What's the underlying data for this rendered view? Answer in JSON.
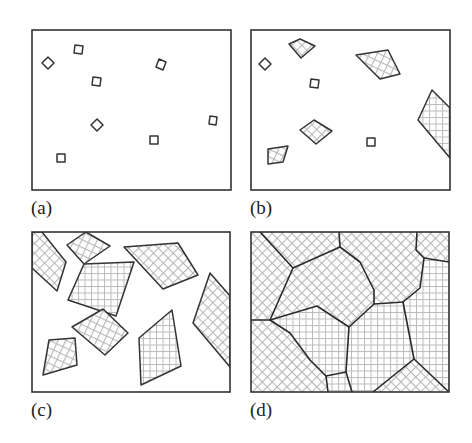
{
  "figure": {
    "colors": {
      "outline": "#2a2a2a",
      "hatch": "#b8b8b8",
      "background": "#ffffff"
    },
    "panels": [
      {
        "id": "a",
        "label": "(a)",
        "stage": "nucleation",
        "frame": [
          32,
          30,
          231,
          190
        ],
        "nuclei": [
          [
            [
              48,
              57
            ],
            [
              54,
              63
            ],
            [
              48,
              69
            ],
            [
              42,
              63
            ]
          ],
          [
            [
              75,
              45
            ],
            [
              83,
              46
            ],
            [
              82,
              54
            ],
            [
              74,
              53
            ]
          ],
          [
            [
              93,
              77
            ],
            [
              101,
              78
            ],
            [
              100,
              86
            ],
            [
              92,
              85
            ]
          ],
          [
            [
              159,
              59
            ],
            [
              166,
              62
            ],
            [
              163,
              70
            ],
            [
              156,
              67
            ]
          ],
          [
            [
              97,
              119
            ],
            [
              103,
              125
            ],
            [
              97,
              131
            ],
            [
              91,
              125
            ]
          ],
          [
            [
              150,
              136
            ],
            [
              158,
              136
            ],
            [
              158,
              144
            ],
            [
              150,
              144
            ]
          ],
          [
            [
              210,
              116
            ],
            [
              217,
              117
            ],
            [
              216,
              125
            ],
            [
              209,
              124
            ]
          ],
          [
            [
              57,
              154
            ],
            [
              65,
              154
            ],
            [
              65,
              162
            ],
            [
              57,
              162
            ]
          ]
        ]
      },
      {
        "id": "b",
        "label": "(b)",
        "stage": "early growth",
        "frame": [
          251,
          30,
          450,
          190
        ],
        "nuclei": [
          [
            [
              265,
              58
            ],
            [
              271,
              64
            ],
            [
              265,
              70
            ],
            [
              259,
              64
            ]
          ],
          [
            [
              311,
              79
            ],
            [
              319,
              80
            ],
            [
              318,
              88
            ],
            [
              310,
              87
            ]
          ],
          [
            [
              367,
              138
            ],
            [
              375,
              138
            ],
            [
              375,
              146
            ],
            [
              367,
              146
            ]
          ]
        ],
        "grains": [
          [
            [
              289,
              44
            ],
            [
              300,
              39
            ],
            [
              315,
              46
            ],
            [
              301,
              58
            ]
          ],
          [
            [
              356,
              55
            ],
            [
              388,
              50
            ],
            [
              400,
              74
            ],
            [
              380,
              79
            ]
          ],
          [
            [
              432,
              90
            ],
            [
              450,
              108
            ],
            [
              450,
              158
            ],
            [
              418,
              120
            ]
          ],
          [
            [
              300,
              130
            ],
            [
              314,
              120
            ],
            [
              332,
              131
            ],
            [
              316,
              144
            ]
          ],
          [
            [
              268,
              149
            ],
            [
              288,
              146
            ],
            [
              283,
              162
            ],
            [
              268,
              164
            ]
          ]
        ]
      },
      {
        "id": "c",
        "label": "(c)",
        "stage": "continued growth",
        "frame": [
          32,
          232,
          230,
          392
        ],
        "grains": [
          [
            [
              32,
              232
            ],
            [
              42,
              232
            ],
            [
              66,
              262
            ],
            [
              57,
              291
            ],
            [
              32,
              268
            ]
          ],
          [
            [
              67,
              245
            ],
            [
              86,
              232
            ],
            [
              110,
              246
            ],
            [
              84,
              264
            ]
          ],
          [
            [
              84,
              264
            ],
            [
              134,
              262
            ],
            [
              116,
              316
            ],
            [
              68,
              300
            ]
          ],
          [
            [
              124,
              247
            ],
            [
              178,
              243
            ],
            [
              198,
              275
            ],
            [
              163,
              289
            ]
          ],
          [
            [
              72,
              327
            ],
            [
              103,
              309
            ],
            [
              128,
              333
            ],
            [
              105,
              355
            ]
          ],
          [
            [
              139,
              338
            ],
            [
              172,
              310
            ],
            [
              181,
              366
            ],
            [
              141,
              385
            ]
          ],
          [
            [
              210,
              273
            ],
            [
              230,
              296
            ],
            [
              230,
              367
            ],
            [
              193,
              323
            ]
          ],
          [
            [
              49,
              340
            ],
            [
              75,
              338
            ],
            [
              77,
              365
            ],
            [
              43,
              375
            ]
          ]
        ]
      },
      {
        "id": "d",
        "label": "(d)",
        "stage": "impingement and final grain structure",
        "frame": [
          251,
          232,
          449,
          392
        ],
        "boundaries": [
          [
            [
              260,
              232
            ],
            [
              293,
              268
            ],
            [
              340,
              247
            ],
            [
              339,
              232
            ]
          ],
          [
            [
              340,
              247
            ],
            [
              360,
              262
            ],
            [
              374,
              290
            ],
            [
              374,
              304
            ]
          ],
          [
            [
              293,
              268
            ],
            [
              270,
              320
            ]
          ],
          [
            [
              251,
              320
            ],
            [
              270,
              320
            ],
            [
              317,
              306
            ],
            [
              349,
              327
            ],
            [
              374,
              304
            ],
            [
              403,
              302
            ],
            [
              420,
              288
            ],
            [
              424,
              258
            ],
            [
              416,
              250
            ],
            [
              417,
              232
            ]
          ],
          [
            [
              424,
              258
            ],
            [
              449,
              262
            ]
          ],
          [
            [
              270,
              320
            ],
            [
              290,
              333
            ],
            [
              310,
              360
            ],
            [
              326,
              376
            ],
            [
              328,
              392
            ]
          ],
          [
            [
              326,
              376
            ],
            [
              346,
              372
            ],
            [
              352,
              392
            ]
          ],
          [
            [
              349,
              327
            ],
            [
              346,
              372
            ]
          ],
          [
            [
              403,
              302
            ],
            [
              414,
              359
            ],
            [
              373,
              392
            ]
          ],
          [
            [
              414,
              359
            ],
            [
              449,
              392
            ]
          ]
        ]
      }
    ]
  }
}
